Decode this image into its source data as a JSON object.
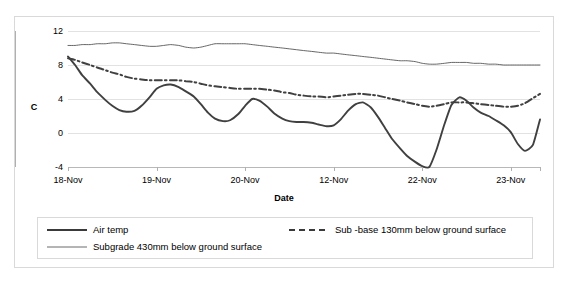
{
  "chart_data": {
    "type": "line",
    "title": "",
    "xlabel": "Date",
    "ylabel": "C",
    "ylim": [
      -4,
      12
    ],
    "yticks": [
      12,
      8,
      4,
      0,
      -4
    ],
    "xticks": [
      "18-Nov",
      "19-Nov",
      "20-Nov",
      "12-Nov",
      "22-Nov",
      "23-Nov"
    ],
    "grid": true,
    "legend_position": "bottom",
    "x": [
      0,
      0.08,
      0.16,
      0.25,
      0.33,
      0.42,
      0.5,
      0.58,
      0.66,
      0.75,
      0.83,
      0.92,
      1.0,
      1.08,
      1.16,
      1.25,
      1.33,
      1.42,
      1.5,
      1.58,
      1.66,
      1.75,
      1.83,
      1.92,
      2.0,
      2.08,
      2.16,
      2.25,
      2.33,
      2.42,
      2.5,
      2.58,
      2.66,
      2.75,
      2.83,
      2.92,
      3.0,
      3.08,
      3.16,
      3.25,
      3.33,
      3.42,
      3.5,
      3.58,
      3.66,
      3.75,
      3.83,
      3.92,
      4.0,
      4.08,
      4.16,
      4.25,
      4.33,
      4.42,
      4.5,
      4.58,
      4.66,
      4.75,
      4.83,
      4.92,
      5.0,
      5.08,
      5.16,
      5.25,
      5.33
    ],
    "series": [
      {
        "name": "Air temp",
        "style": "solid-thick",
        "color": "#404040",
        "values": [
          9.0,
          8.0,
          6.8,
          5.8,
          4.8,
          3.9,
          3.2,
          2.7,
          2.5,
          2.6,
          3.2,
          4.2,
          5.2,
          5.6,
          5.7,
          5.4,
          4.9,
          4.3,
          3.4,
          2.4,
          1.7,
          1.4,
          1.5,
          2.2,
          3.2,
          4.0,
          3.8,
          3.1,
          2.3,
          1.7,
          1.4,
          1.3,
          1.3,
          1.2,
          1.0,
          0.8,
          0.9,
          1.6,
          2.6,
          3.4,
          3.6,
          3.0,
          1.9,
          0.6,
          -0.7,
          -1.8,
          -2.7,
          -3.4,
          -3.9,
          -4.0,
          -2.0,
          1.0,
          3.3,
          4.2,
          3.8,
          3.0,
          2.4,
          2.0,
          1.5,
          0.9,
          0.1,
          -1.3,
          -2.1,
          -1.4,
          1.6
        ]
      },
      {
        "name": "Sub -base 130mm below ground surface",
        "style": "dash-dot-thick",
        "color": "#404040",
        "values": [
          8.8,
          8.6,
          8.3,
          8.0,
          7.7,
          7.4,
          7.1,
          6.9,
          6.6,
          6.4,
          6.3,
          6.2,
          6.2,
          6.2,
          6.2,
          6.2,
          6.1,
          6.0,
          5.8,
          5.6,
          5.5,
          5.4,
          5.3,
          5.2,
          5.2,
          5.2,
          5.2,
          5.1,
          5.0,
          4.8,
          4.7,
          4.5,
          4.4,
          4.3,
          4.3,
          4.2,
          4.3,
          4.4,
          4.5,
          4.6,
          4.6,
          4.5,
          4.4,
          4.2,
          4.0,
          3.8,
          3.6,
          3.4,
          3.2,
          3.1,
          3.2,
          3.4,
          3.6,
          3.6,
          3.6,
          3.5,
          3.4,
          3.3,
          3.2,
          3.1,
          3.1,
          3.2,
          3.5,
          4.1,
          4.6
        ]
      },
      {
        "name": "Subgrade 430mm below ground surface",
        "style": "solid-thin",
        "color": "#4a4a4a",
        "values": [
          10.3,
          10.3,
          10.4,
          10.4,
          10.5,
          10.5,
          10.6,
          10.6,
          10.5,
          10.4,
          10.3,
          10.2,
          10.2,
          10.3,
          10.4,
          10.3,
          10.1,
          10.0,
          10.1,
          10.3,
          10.5,
          10.5,
          10.5,
          10.5,
          10.5,
          10.4,
          10.3,
          10.2,
          10.1,
          10.0,
          9.9,
          9.8,
          9.7,
          9.6,
          9.5,
          9.4,
          9.4,
          9.3,
          9.2,
          9.1,
          9.0,
          8.9,
          8.8,
          8.7,
          8.6,
          8.5,
          8.5,
          8.4,
          8.2,
          8.1,
          8.1,
          8.2,
          8.3,
          8.3,
          8.3,
          8.2,
          8.2,
          8.1,
          8.1,
          8.0,
          8.0,
          8.0,
          8.0,
          8.0,
          8.0
        ]
      }
    ]
  },
  "axes": {
    "y_title": "C",
    "x_title": "Date"
  },
  "legend": {
    "air_temp": "Air temp",
    "sub_base": "Sub -base 130mm below ground surface",
    "subgrade": "Subgrade 430mm below ground surface"
  }
}
